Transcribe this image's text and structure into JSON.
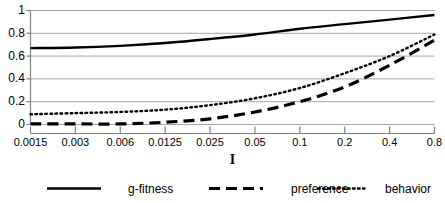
{
  "chart_data": {
    "type": "line",
    "title": "",
    "xlabel": "I",
    "ylabel": "",
    "xscale": "log-category",
    "grid": true,
    "legend_position": "bottom",
    "x_tick_labels": [
      "0.0015",
      "0.003",
      "0.006",
      "0.0125",
      "0.025",
      "0.05",
      "0.1",
      "0.2",
      "0.4",
      "0.8"
    ],
    "x": [
      0.0015,
      0.003,
      0.006,
      0.0125,
      0.025,
      0.05,
      0.1,
      0.2,
      0.4,
      0.8
    ],
    "y_tick_labels": [
      "0",
      "0.2",
      "0.4",
      "0.6",
      "0.8",
      "1"
    ],
    "ylim": [
      0,
      1
    ],
    "yticks": [
      0,
      0.2,
      0.4,
      0.6,
      0.8,
      1
    ],
    "series": [
      {
        "name": "g-fitness",
        "style": "solid",
        "color": "#000000",
        "values": [
          0.67,
          0.675,
          0.69,
          0.715,
          0.75,
          0.79,
          0.84,
          0.88,
          0.92,
          0.96
        ]
      },
      {
        "name": "preference",
        "style": "dashed",
        "color": "#000000",
        "values": [
          0.005,
          0.005,
          0.005,
          0.02,
          0.05,
          0.11,
          0.2,
          0.33,
          0.52,
          0.74
        ]
      },
      {
        "name": "behavior",
        "style": "dotted",
        "color": "#000000",
        "values": [
          0.09,
          0.1,
          0.11,
          0.13,
          0.17,
          0.23,
          0.32,
          0.45,
          0.6,
          0.79
        ]
      }
    ]
  },
  "legend": {
    "items": [
      {
        "label": "g-fitness",
        "style": "solid"
      },
      {
        "label": "preference",
        "style": "dashed"
      },
      {
        "label": "behavior",
        "style": "dotted"
      }
    ]
  },
  "colors": {
    "ink": "#000000",
    "grid": "#a6a6a6",
    "axis": "#808080",
    "background": "#ffffff"
  }
}
